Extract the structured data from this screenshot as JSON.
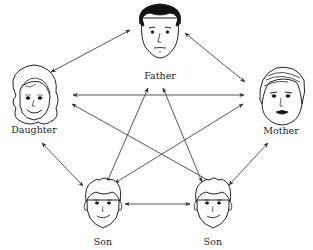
{
  "diagram": {
    "type": "family-relationship-network",
    "nodes": [
      {
        "id": "father",
        "label": "Father",
        "cx": 160,
        "cy": 32,
        "lx": 160,
        "ly": 79
      },
      {
        "id": "daughter",
        "label": "Daughter",
        "cx": 34,
        "cy": 100,
        "lx": 34,
        "ly": 133
      },
      {
        "id": "mother",
        "label": "Mother",
        "cx": 280,
        "cy": 100,
        "lx": 281,
        "ly": 134
      },
      {
        "id": "son-left",
        "label": "Son",
        "cx": 103,
        "cy": 208,
        "lx": 103,
        "ly": 245
      },
      {
        "id": "son-right",
        "label": "Son",
        "cx": 213,
        "cy": 208,
        "lx": 213,
        "ly": 245
      }
    ],
    "edges": [
      {
        "from": "father",
        "to": "daughter",
        "direction": "both"
      },
      {
        "from": "father",
        "to": "mother",
        "direction": "both"
      },
      {
        "from": "father",
        "to": "son-left",
        "direction": "both"
      },
      {
        "from": "father",
        "to": "son-right",
        "direction": "both"
      },
      {
        "from": "daughter",
        "to": "mother",
        "direction": "both"
      },
      {
        "from": "daughter",
        "to": "son-left",
        "direction": "both"
      },
      {
        "from": "daughter",
        "to": "son-right",
        "direction": "both"
      },
      {
        "from": "mother",
        "to": "son-left",
        "direction": "both"
      },
      {
        "from": "mother",
        "to": "son-right",
        "direction": "both"
      },
      {
        "from": "son-left",
        "to": "son-right",
        "direction": "both"
      }
    ]
  },
  "labels": {
    "father": "Father",
    "daughter": "Daughter",
    "mother": "Mother",
    "son_left": "Son",
    "son_right": "Son"
  }
}
